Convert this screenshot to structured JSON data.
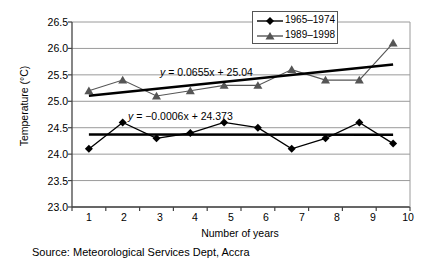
{
  "chart_data": {
    "type": "line",
    "title": "",
    "xlabel": "Number of years",
    "ylabel": "Temperature (°C)",
    "categories": [
      1,
      2,
      3,
      4,
      5,
      6,
      7,
      8,
      9,
      10
    ],
    "xtick_labels": [
      "1",
      "2",
      "3",
      "4",
      "5",
      "6",
      "7",
      "8",
      "9",
      "10"
    ],
    "ytick_labels": [
      "26.5",
      "26.0",
      "25.5",
      "25.0",
      "24.5",
      "24.0",
      "23.5",
      "23.0"
    ],
    "ytick_values": [
      26.5,
      26.0,
      25.5,
      25.0,
      24.5,
      24.0,
      23.5,
      23.0
    ],
    "ylim": [
      23.0,
      26.5
    ],
    "ytick_step": 0.5,
    "grid": true,
    "grid_axis": "y",
    "legend_position": "top-right",
    "series": [
      {
        "name": "1965–1974",
        "marker": "diamond",
        "color": "#000000",
        "values": [
          24.1,
          24.6,
          24.3,
          24.4,
          24.6,
          24.5,
          24.1,
          24.3,
          24.6,
          24.2
        ],
        "trendline": {
          "equation": "y = −0.0006x + 24.373",
          "slope": -0.0006,
          "intercept": 24.373,
          "y_start": 24.3724,
          "y_end": 24.367
        }
      },
      {
        "name": "1989–1998",
        "marker": "triangle",
        "color": "#555555",
        "values": [
          25.2,
          25.4,
          25.1,
          25.2,
          25.3,
          25.3,
          25.6,
          25.4,
          25.4,
          26.1
        ],
        "trendline": {
          "equation": "y = 0.0655x + 25.04",
          "slope": 0.0655,
          "intercept": 25.04,
          "y_start": 25.1055,
          "y_end": 25.695
        }
      }
    ],
    "annotations": [
      {
        "name": "upper-trend-equation",
        "text": "y = 0.0655x + 25.04"
      },
      {
        "name": "lower-trend-equation",
        "text": "y = −0.0006x + 24.373"
      }
    ]
  },
  "legend": {
    "items": [
      {
        "label": "1965–1974"
      },
      {
        "label": "1989–1998"
      }
    ]
  },
  "caption": {
    "source": "Source: Meteorological Services Dept, Accra"
  },
  "colors": {
    "series1": "#000000",
    "series2": "#555555",
    "grid": "#9a9a9a",
    "axis": "#444444",
    "trend": "#000000"
  },
  "equations": {
    "upper_prefix": "y",
    "upper_rest": " = 0.0655x + 25.04",
    "lower_prefix": "y",
    "lower_rest": " = −0.0006x + 24.373"
  }
}
